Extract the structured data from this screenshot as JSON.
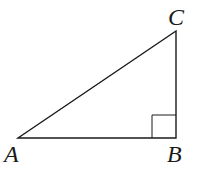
{
  "diagram": {
    "type": "right-triangle",
    "stroke_color": "#1a1a1a",
    "background": "#ffffff",
    "vertices": {
      "A": {
        "label": "A",
        "x": 18,
        "y": 138
      },
      "B": {
        "label": "B",
        "x": 176,
        "y": 138
      },
      "C": {
        "label": "C",
        "x": 176,
        "y": 31
      }
    },
    "right_angle_at": "B",
    "right_angle_marker_size": 24
  }
}
